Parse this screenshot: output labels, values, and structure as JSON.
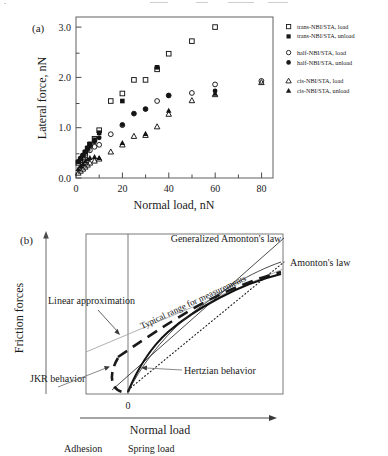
{
  "figure": {
    "panel_a_tag": "(a)",
    "panel_b_tag": "(b)"
  },
  "chart_data": [
    {
      "type": "scatter",
      "panel": "(a)",
      "title": "",
      "xlabel": "Normal load, nN",
      "ylabel": "Lateral force, nN",
      "xlim": [
        0,
        85
      ],
      "ylim": [
        0.0,
        3.2
      ],
      "xticks": [
        0,
        20,
        40,
        60,
        80
      ],
      "yticks": [
        "0.0",
        "1.0",
        "2.0",
        "3.0"
      ],
      "xtick_labels": [
        "0",
        "20",
        "40",
        "60",
        "80"
      ],
      "ytick_labels": [
        "0.0",
        "1.0",
        "2.0",
        "3.0"
      ],
      "grid": false,
      "legend_position": "outside-right",
      "series": [
        {
          "name": "trans-NBI/STA, load",
          "marker": "open-square",
          "x": [
            1,
            2,
            3,
            4,
            5,
            6,
            8,
            10,
            15,
            20,
            25,
            30,
            35,
            40,
            50,
            60
          ],
          "y": [
            0.3,
            0.36,
            0.42,
            0.5,
            0.58,
            0.66,
            0.78,
            0.95,
            1.53,
            1.68,
            1.95,
            1.95,
            2.16,
            2.47,
            2.72,
            3.0
          ]
        },
        {
          "name": "trans-NBI/STA, unload",
          "marker": "filled-square",
          "x": [
            1,
            2,
            3,
            4,
            5,
            6,
            8,
            10,
            20,
            35
          ],
          "y": [
            0.32,
            0.38,
            0.45,
            0.52,
            0.6,
            0.68,
            0.76,
            0.9,
            1.53,
            2.2
          ]
        },
        {
          "name": "half-NBI/STA, load",
          "marker": "open-circle",
          "x": [
            2,
            4,
            6,
            8,
            10,
            15,
            20,
            25,
            30,
            35,
            40,
            50,
            60,
            80
          ],
          "y": [
            0.35,
            0.45,
            0.55,
            0.62,
            0.66,
            0.87,
            1.05,
            1.28,
            1.37,
            1.53,
            1.64,
            1.69,
            1.86,
            1.93
          ]
        },
        {
          "name": "half-NBI/STA, unload",
          "marker": "filled-circle",
          "x": [
            1,
            2,
            3,
            4,
            5,
            6,
            8,
            10,
            20,
            25,
            30,
            40,
            60
          ],
          "y": [
            0.33,
            0.4,
            0.46,
            0.52,
            0.58,
            0.64,
            0.72,
            0.8,
            1.06,
            1.28,
            1.37,
            1.64,
            1.73
          ]
        },
        {
          "name": "cis-NBI/STA, load",
          "marker": "open-triangle",
          "x": [
            1,
            2,
            3,
            4,
            5,
            6,
            8,
            10,
            15,
            20,
            25,
            30,
            35,
            40,
            50,
            60,
            80
          ],
          "y": [
            0.1,
            0.14,
            0.18,
            0.22,
            0.26,
            0.3,
            0.34,
            0.38,
            0.52,
            0.66,
            0.83,
            0.85,
            1.02,
            1.27,
            1.54,
            1.66,
            1.9
          ]
        },
        {
          "name": "cis-NBI/STA, unload",
          "marker": "filled-triangle",
          "x": [
            1,
            2,
            3,
            4,
            5,
            6,
            8,
            10,
            20,
            30,
            40,
            60
          ],
          "y": [
            0.18,
            0.24,
            0.28,
            0.33,
            0.37,
            0.4,
            0.42,
            0.4,
            0.7,
            0.88,
            1.34,
            1.68
          ]
        }
      ],
      "legend": [
        {
          "label": "trans-NBI/STA, load",
          "marker": "open-square"
        },
        {
          "label": "trans-NBI/STA, unload",
          "marker": "filled-square"
        },
        {
          "label": "half-NBI/STA, load",
          "marker": "open-circle"
        },
        {
          "label": "half-NBI/STA, unload",
          "marker": "filled-circle"
        },
        {
          "label": "cis-NBI/STA, load",
          "marker": "open-triangle"
        },
        {
          "label": "cis-NBI/STA, unload",
          "marker": "filled-triangle"
        }
      ]
    },
    {
      "type": "line",
      "panel": "(b)",
      "title": "",
      "xlabel": "Normal load",
      "ylabel": "Friction forces",
      "origin_label": "0",
      "grid": false,
      "annotations": [
        "Generalized Amonton's law",
        "Amonton's law",
        "Typical range for measurements",
        "Linear approximation",
        "JKR behavior",
        "Hertzian behavior"
      ],
      "axis_regions": [
        "Adhesion",
        "Spring load"
      ],
      "curves": [
        {
          "name": "Generalized Amonton's law",
          "style": "solid-thin"
        },
        {
          "name": "Amonton's law",
          "style": "dotted"
        },
        {
          "name": "Typical range for measurements",
          "style": "dashed-thick"
        },
        {
          "name": "Linear approximation",
          "style": "solid-light"
        },
        {
          "name": "JKR behavior",
          "style": "dashed-thick"
        },
        {
          "name": "Hertzian behavior",
          "style": "solid-thick"
        }
      ]
    }
  ],
  "panel_a": {
    "tag": "(a)",
    "x_axis_title": "Normal load, nN",
    "y_axis_title": "Lateral force, nN",
    "xtick_0": "0",
    "xtick_20": "20",
    "xtick_40": "40",
    "xtick_60": "60",
    "xtick_80": "80",
    "ytick_00": "0.0",
    "ytick_10": "1.0",
    "ytick_20": "2.0",
    "ytick_30": "3.0",
    "legend": {
      "item0": "trans-NBI/STA, load",
      "item1": "trans-NBI/STA, unload",
      "item2": "half-NBI/STA, load",
      "item3": "half-NBI/STA, unload",
      "item4": "cis-NBI/STA, load",
      "item5": "cis-NBI/STA, unload"
    }
  },
  "panel_b": {
    "tag": "(b)",
    "y_axis_title": "Friction forces",
    "x_axis_title": "Normal load",
    "origin": "0",
    "label_generalized": "Generalized Amonton's law",
    "label_amonton": "Amonton's law",
    "label_typical": "Typical range for measurements",
    "label_linear": "Linear approximation",
    "label_jkr": "JKR behavior",
    "label_hertzian": "Hertzian behavior",
    "label_adhesion": "Adhesion",
    "label_spring": "Spring load"
  },
  "colors": {
    "ink": "#1a1a1a",
    "frame": "#555555",
    "light": "#9a9a9a",
    "background": "#ffffff"
  }
}
